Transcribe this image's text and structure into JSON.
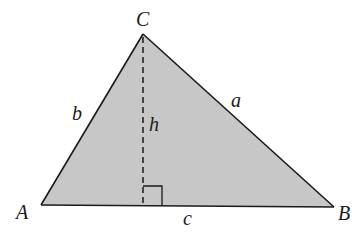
{
  "diagram": {
    "fill_color": "#c8c8c8",
    "stroke_color": "#1a1a1a",
    "vertices": {
      "A": {
        "label": "A",
        "x": 41,
        "y": 205
      },
      "B": {
        "label": "B",
        "x": 334,
        "y": 207
      },
      "C": {
        "label": "C",
        "x": 143,
        "y": 34
      }
    },
    "sides": {
      "a": {
        "label": "a"
      },
      "b": {
        "label": "b"
      },
      "c": {
        "label": "c"
      }
    },
    "altitude": {
      "label": "h",
      "style": "dashed"
    },
    "right_angle_marker": true
  }
}
